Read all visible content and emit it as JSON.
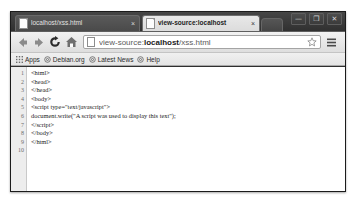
{
  "window": {
    "controls": [
      {
        "name": "minimize",
        "glyph": "—"
      },
      {
        "name": "maximize",
        "glyph": "❐"
      },
      {
        "name": "close",
        "glyph": "✕"
      }
    ]
  },
  "tabs": [
    {
      "title": "localhost/xss.html",
      "close": "×",
      "active": false
    },
    {
      "title": "view-source:localhost",
      "close": "×",
      "active": true
    }
  ],
  "toolbar": {
    "back_icon": "back-arrow-icon",
    "forward_icon": "forward-arrow-icon",
    "reload_icon": "reload-icon",
    "home_icon": "home-icon",
    "url": "view-source:",
    "url_host": "localhost",
    "url_path": "/xss.html",
    "url_placeholder": "Search Google or type URL",
    "bookmark_star_icon": "star-icon",
    "menu_icon": "hamburger-menu-icon"
  },
  "bookmarks": [
    {
      "label": "Apps",
      "icon": "apps-grid-icon"
    },
    {
      "label": "Debian.org",
      "icon": "bookmark-globe-icon"
    },
    {
      "label": "Latest News",
      "icon": "bookmark-globe-icon"
    },
    {
      "label": "Help",
      "icon": "bookmark-globe-icon"
    }
  ],
  "source": {
    "line_numbers": [
      "1",
      "2",
      "3",
      "4",
      "5",
      "6",
      "7",
      "8",
      "9",
      "10"
    ],
    "lines": [
      "<html>",
      "<head>",
      "</head>",
      "<body>",
      "<script type=\"text/javascript\">",
      "document.write(\"A script was used to display this text\");",
      "</script>",
      "</body>",
      "</html>",
      ""
    ]
  }
}
